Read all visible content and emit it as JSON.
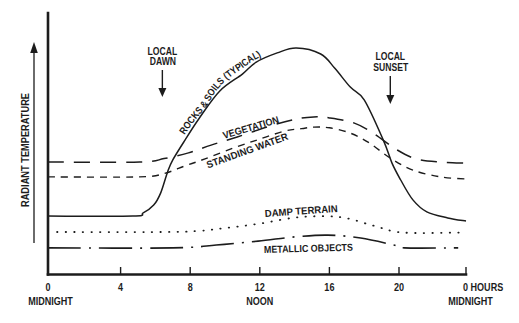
{
  "chart_data": {
    "type": "line",
    "title": "",
    "xlabel": "HOURS",
    "ylabel": "RADIANT TEMPERATURE",
    "xlim": [
      0,
      24
    ],
    "ylim": [
      0,
      100
    ],
    "x_ticks": [
      0,
      4,
      8,
      12,
      16,
      20,
      24
    ],
    "x_tick_labels": [
      "0",
      "4",
      "8",
      "12",
      "16",
      "20",
      "0 HOURS"
    ],
    "x_sublabels": [
      {
        "x": 0,
        "label": "MIDNIGHT"
      },
      {
        "x": 12,
        "label": "NOON"
      },
      {
        "x": 24,
        "label": "MIDNIGHT"
      }
    ],
    "y_ticks": [],
    "grid": false,
    "legend": "none (series labeled inline on curves)",
    "annotations": [
      {
        "lines": [
          "LOCAL",
          "DAWN"
        ],
        "x": 6.4,
        "arrow": "down"
      },
      {
        "lines": [
          "LOCAL",
          "SUNSET"
        ],
        "x": 19.5,
        "arrow": "down"
      }
    ],
    "series": [
      {
        "name": "ROCKS & SOILS (TYPICAL)",
        "line_style": "solid",
        "x": [
          0,
          4.7,
          5.3,
          5.9,
          6.3,
          6.7,
          7.0,
          7.7,
          8.5,
          9.7,
          11.0,
          11.8,
          13.0,
          14.1,
          15.5,
          16.3,
          17.2,
          18.0,
          19.1,
          19.6,
          20.1,
          20.8,
          21.6,
          22.8,
          24
        ],
        "y": [
          22.2,
          22.2,
          23.4,
          26.4,
          31.0,
          39.1,
          43.7,
          51.3,
          59.5,
          70.1,
          76.6,
          81.2,
          84.7,
          86.6,
          84.3,
          78.9,
          71.6,
          66.7,
          51.3,
          42.5,
          36.0,
          28.4,
          23.8,
          21.5,
          20.3
        ]
      },
      {
        "name": "VEGETATION",
        "line_style": "long-dash",
        "x": [
          0,
          5.1,
          6.5,
          7.9,
          9.2,
          10.7,
          12.6,
          14.1,
          15.1,
          16.0,
          17.4,
          18.5,
          19.9,
          21.0,
          22.4,
          24
        ],
        "y": [
          42.9,
          42.9,
          44.2,
          46.4,
          49.4,
          52.5,
          56.7,
          59.4,
          60.2,
          59.8,
          57.9,
          54.0,
          47.5,
          44.1,
          42.9,
          42.5
        ]
      },
      {
        "name": "STANDING WATER",
        "line_style": "short-dash",
        "x": [
          0,
          5.1,
          6.5,
          7.7,
          8.85,
          10.5,
          12.0,
          13.45,
          14.4,
          15.1,
          16.0,
          17.2,
          18.3,
          19.5,
          20.8,
          22.4,
          24
        ],
        "y": [
          37.2,
          37.2,
          38.5,
          41.4,
          44.1,
          48.3,
          51.7,
          54.8,
          55.7,
          56.3,
          56.0,
          54.0,
          50.2,
          44.4,
          39.8,
          37.2,
          36.4
        ]
      },
      {
        "name": "DAMP TERRAIN",
        "line_style": "dotted",
        "x": [
          0.35,
          6.4,
          8.5,
          10.0,
          11.9,
          14.3,
          16.6,
          18.5,
          20.2,
          23.7
        ],
        "y": [
          16.1,
          16.1,
          16.5,
          17.6,
          19.2,
          21.8,
          21.8,
          18.6,
          15.9,
          15.9
        ]
      },
      {
        "name": "METALLIC OBJECTS",
        "line_style": "dash-dot",
        "x": [
          0,
          7.0,
          9.5,
          11.9,
          14.0,
          15.9,
          17.8,
          19.7,
          20.3,
          23.4
        ],
        "y": [
          10.0,
          10.0,
          11.1,
          12.6,
          14.2,
          14.9,
          13.8,
          11.1,
          10.0,
          10.0
        ]
      }
    ]
  }
}
